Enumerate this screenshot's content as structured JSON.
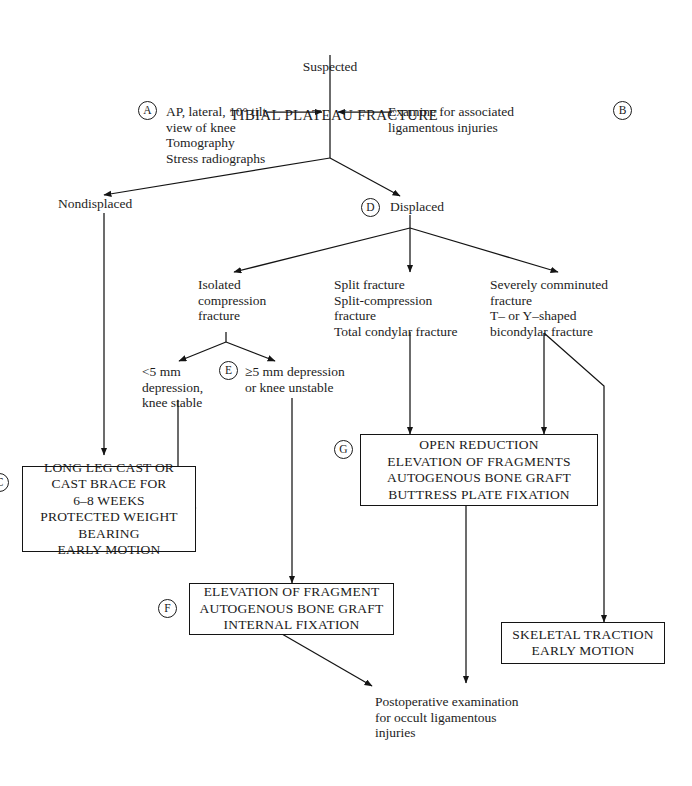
{
  "diagram": {
    "title_sub": "Suspected",
    "title_main": "TIBIAL PLATEAU FRACTURE"
  },
  "tags": {
    "a": "A",
    "b": "B",
    "c": "C",
    "d": "D",
    "e": "E",
    "f": "F",
    "g": "G"
  },
  "nodes": {
    "workup_a": "AP, lateral, 10° tilt\nview of knee\nTomography\nStress radiographs",
    "workup_b": "Examine for associated\nligamentous injuries",
    "nondisplaced": "Nondisplaced",
    "displaced": "Displaced",
    "isolated_compression": "Isolated\ncompression\nfracture",
    "split_group": "Split fracture\nSplit-compression\nfracture\nTotal condylar fracture",
    "comminuted_group": "Severely comminuted\nfracture\nT– or Y–shaped\nbicondylar fracture",
    "less_than_5mm": "<5 mm\ndepression,\nknee stable",
    "five_mm_or_more": "≥5 mm depression\nor knee unstable",
    "postoperative": "Postoperative examination\nfor occult ligamentous\ninjuries"
  },
  "boxes": {
    "long_leg_cast": "LONG LEG CAST OR\nCAST BRACE FOR\n6–8 WEEKS\nPROTECTED WEIGHT\nBEARING\nEARLY MOTION",
    "open_reduction": "OPEN REDUCTION\nELEVATION OF FRAGMENTS\nAUTOGENOUS BONE GRAFT\nBUTTRESS PLATE FIXATION",
    "elevation_fragment": "ELEVATION OF FRAGMENT\nAUTOGENOUS BONE GRAFT\nINTERNAL FIXATION",
    "skeletal_traction": "SKELETAL TRACTION\nEARLY MOTION"
  },
  "colors": {
    "ink": "#1a1a1a",
    "line": "#141414",
    "background": "#ffffff"
  }
}
